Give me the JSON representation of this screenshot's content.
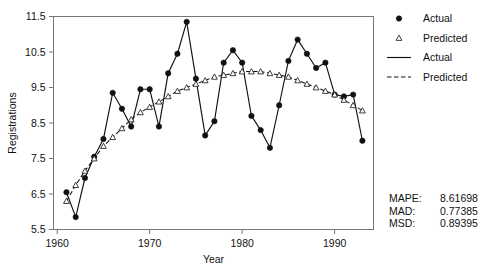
{
  "chart_data": {
    "type": "line",
    "title": "",
    "xlabel": "Year",
    "ylabel": "Registrations",
    "xlim": [
      1959.6,
      1994.2
    ],
    "ylim": [
      5.5,
      11.5
    ],
    "xticks": [
      1960,
      1970,
      1980,
      1990
    ],
    "xticklabels": [
      "1960",
      "1970",
      "1980",
      "1990"
    ],
    "yticks": [
      5.5,
      6.5,
      7.5,
      8.5,
      9.5,
      10.5,
      11.5
    ],
    "yticklabels": [
      "5.5",
      "6.5",
      "7.5",
      "8.5",
      "9.5",
      "10.5",
      "11.5"
    ],
    "grid": false,
    "x": [
      1961,
      1962,
      1963,
      1964,
      1965,
      1966,
      1967,
      1968,
      1969,
      1970,
      1971,
      1972,
      1973,
      1974,
      1975,
      1976,
      1977,
      1978,
      1979,
      1980,
      1981,
      1982,
      1983,
      1984,
      1985,
      1986,
      1987,
      1988,
      1989,
      1990,
      1991,
      1992,
      1993
    ],
    "series": [
      {
        "name": "Actual",
        "marker": "filled-circle",
        "linestyle": "solid",
        "values": [
          6.55,
          5.85,
          6.95,
          7.55,
          8.05,
          9.35,
          8.9,
          8.4,
          9.45,
          9.45,
          8.4,
          9.9,
          10.45,
          11.35,
          9.75,
          8.15,
          8.55,
          10.2,
          10.55,
          10.2,
          8.7,
          8.3,
          7.8,
          9.0,
          10.25,
          10.85,
          10.45,
          10.05,
          10.2,
          9.3,
          9.25,
          9.3,
          8.0
        ]
      },
      {
        "name": "Predicted",
        "marker": "open-triangle",
        "linestyle": "dashed",
        "values": [
          6.3,
          6.75,
          7.15,
          7.5,
          7.85,
          8.1,
          8.35,
          8.6,
          8.8,
          8.95,
          9.1,
          9.25,
          9.4,
          9.5,
          9.6,
          9.7,
          9.8,
          9.85,
          9.9,
          9.95,
          9.95,
          9.95,
          9.9,
          9.85,
          9.8,
          9.7,
          9.6,
          9.5,
          9.4,
          9.3,
          9.15,
          9.0,
          8.85
        ]
      }
    ],
    "legend": {
      "position": "right",
      "entries": [
        {
          "label": "Actual",
          "type": "marker",
          "marker": "filled-circle"
        },
        {
          "label": "Predicted",
          "type": "marker",
          "marker": "open-triangle"
        },
        {
          "label": "Actual",
          "type": "line",
          "linestyle": "solid"
        },
        {
          "label": "Predicted",
          "type": "line",
          "linestyle": "dashed"
        }
      ]
    },
    "annotations": {
      "stats": [
        {
          "label": "MAPE:",
          "value": "8.61698"
        },
        {
          "label": "MAD:",
          "value": "0.77385"
        },
        {
          "label": "MSD:",
          "value": "0.89395"
        }
      ]
    }
  }
}
